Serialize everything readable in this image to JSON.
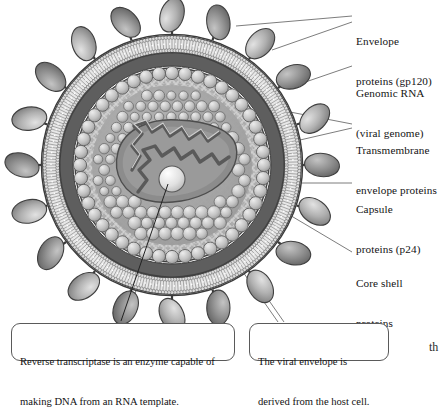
{
  "figure": {
    "background_color": "#ffffff",
    "palette": {
      "outline": "#3a3a3a",
      "envelope_dark_ring": "#5d5d5d",
      "bilayer_light": "#e9e9e9",
      "core_shell": "#8f8f8f",
      "capsid_sphere": "#c9c9c9",
      "spike_knob": "#a8a8a8",
      "leader_line": "#6e6e6e",
      "rna_strand": "#6b6b6b",
      "enzyme_sphere": "#ededed"
    }
  },
  "labels": [
    {
      "id": "envelope-proteins",
      "line1": "Envelope",
      "line2": "proteins (gp120)",
      "x": 356,
      "y": 8
    },
    {
      "id": "genomic-rna",
      "line1": "Genomic RNA",
      "line2": "(viral genome)",
      "x": 356,
      "y": 60
    },
    {
      "id": "transmembrane-envelope-proteins",
      "line1": "Transmembrane",
      "line2": "envelope proteins",
      "x": 356,
      "y": 117
    },
    {
      "id": "capsule-proteins",
      "line1": "Capsule",
      "line2": "proteins (p24)",
      "x": 356,
      "y": 176
    },
    {
      "id": "core-shell-proteins",
      "line1": "Core shell",
      "line2": "proteins",
      "x": 356,
      "y": 250
    }
  ],
  "captions": [
    {
      "id": "reverse-transcriptase-caption",
      "line1": "Reverse transcriptase is an enzyme capable of",
      "line2": "making DNA from an RNA template.",
      "x": 11,
      "y": 323,
      "w": 224,
      "h": 38
    },
    {
      "id": "viral-envelope-caption",
      "line1": "The viral envelope is",
      "line2": "derived from the host cell.",
      "x": 249,
      "y": 323,
      "w": 140,
      "h": 38
    }
  ],
  "corner_text": {
    "text": "th",
    "x": 429,
    "y": 344
  },
  "structure": {
    "center_x": 172,
    "center_y": 165,
    "envelope_outer_radius": 130,
    "envelope_inner_radius": 112,
    "core_shell_radius": 97,
    "capsid_ring_radius": 86,
    "spike_count": 20,
    "capsid_bead_count": 44
  }
}
